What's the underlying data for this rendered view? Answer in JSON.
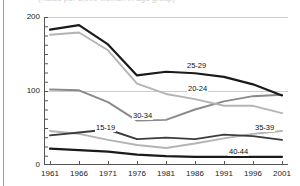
{
  "chart_data": {
    "type": "line",
    "title": "(Rates per 1,000 women in age group)",
    "xlabel": "",
    "ylabel": "",
    "x": [
      1961,
      1966,
      1971,
      1976,
      1981,
      1986,
      1991,
      1996,
      2001
    ],
    "xtick_labels": [
      "1961",
      "1966",
      "1971",
      "1976",
      "1981",
      "1986",
      "1991",
      "1996",
      "2001"
    ],
    "ytick_labels": [
      "0",
      "100",
      "200"
    ],
    "ytick_values": [
      0,
      100,
      200
    ],
    "ylim": [
      0,
      200
    ],
    "xlim": [
      1961,
      2001
    ],
    "grid": "horizontal-major",
    "legend_position": "inline-labels",
    "minor_ticks": true,
    "series": [
      {
        "name": "25-29",
        "label": "25-29",
        "color": "#1a1a1a",
        "values": [
          183,
          189,
          163,
          121,
          126,
          124,
          119,
          109,
          94
        ]
      },
      {
        "name": "20-24",
        "label": "20-24",
        "color": "#b4b4b4",
        "values": [
          176,
          179,
          155,
          110,
          96,
          89,
          80,
          80,
          70
        ]
      },
      {
        "name": "30-34",
        "label": "30-34",
        "color": "#8a8a8a",
        "values": [
          102,
          101,
          85,
          60,
          61,
          75,
          86,
          93,
          95
        ]
      },
      {
        "name": "15-19",
        "label": "15-19",
        "color": "#3c3c3c",
        "values": [
          40,
          44,
          48,
          35,
          37,
          35,
          41,
          39,
          34
        ]
      },
      {
        "name": "35-39",
        "label": "35-39",
        "color": "#b4b4b4",
        "values": [
          46,
          42,
          34,
          27,
          23,
          29,
          36,
          42,
          46
        ]
      },
      {
        "name": "40-44",
        "label": "40-44",
        "color": "#1a1a1a",
        "values": [
          22,
          20,
          18,
          14,
          12,
          11,
          11,
          11,
          11
        ]
      }
    ]
  },
  "axes": {
    "y_ticks": [
      {
        "label": "200",
        "value": 200
      },
      {
        "label": "100",
        "value": 100
      },
      {
        "label": "0",
        "value": 0
      }
    ],
    "x_ticks": [
      {
        "label": "1961",
        "value": 1961
      },
      {
        "label": "1966",
        "value": 1966
      },
      {
        "label": "1971",
        "value": 1971
      },
      {
        "label": "1976",
        "value": 1976
      },
      {
        "label": "1981",
        "value": 1981
      },
      {
        "label": "1986",
        "value": 1986
      },
      {
        "label": "1991",
        "value": 1991
      },
      {
        "label": "1996",
        "value": 1996
      },
      {
        "label": "2001",
        "value": 2001
      }
    ]
  },
  "series_labels": [
    {
      "text": "25-29",
      "left": 186,
      "top": 62
    },
    {
      "text": "20-24",
      "left": 187,
      "top": 85
    },
    {
      "text": "30-34",
      "left": 132,
      "top": 112
    },
    {
      "text": "15-19",
      "left": 95,
      "top": 124
    },
    {
      "text": "35-39",
      "left": 254,
      "top": 124
    },
    {
      "text": "40-44",
      "left": 228,
      "top": 148
    }
  ],
  "colors": {
    "axis": "#555555",
    "gridline": "#cccccc",
    "frame_rule": "#9a9a9a",
    "text": "#1a1a1a",
    "background": "#ffffff"
  }
}
